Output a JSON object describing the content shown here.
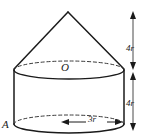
{
  "figure": {
    "kind": "solid-geometry-diagram",
    "stroke_color": "#1a1a1a",
    "background_color": "#ffffff",
    "labels": {
      "apex_center_point": "O",
      "base_point": "A",
      "cone_height": "4r",
      "cylinder_height": "4r",
      "base_radius": "3r"
    },
    "shapes": {
      "cone": {
        "name": "cone",
        "apex_x": 68,
        "apex_y": 12,
        "base_left_x": 14,
        "base_right_x": 124,
        "base_y": 70
      },
      "cylinder": {
        "name": "cylinder",
        "left_x": 14,
        "right_x": 124,
        "top_y": 70,
        "bottom_y": 124,
        "ellipse_ry": 9
      }
    },
    "dimensions": {
      "vertical_axis_x": 133,
      "top_segment": {
        "label": "4r",
        "from_y": 12,
        "to_y": 70
      },
      "bottom_segment": {
        "label": "4r",
        "from_y": 72,
        "to_y": 130
      },
      "radius_segment": {
        "label": "3r",
        "from_x": 62,
        "to_x": 122,
        "y": 122
      }
    }
  }
}
